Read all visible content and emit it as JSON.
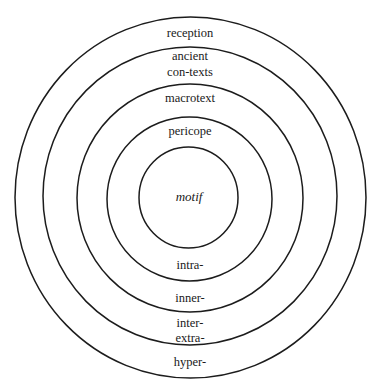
{
  "diagram": {
    "title": "",
    "style": {
      "stroke_color": "#1c1c1c",
      "text_color": "#1a1a1a",
      "background": "#ffffff"
    },
    "rings": [
      {
        "name": "outer",
        "cx": 190.5,
        "cy": 197.5,
        "rx": 175.5,
        "ry": 180.5
      },
      {
        "name": "second",
        "cx": 190,
        "cy": 196,
        "rx": 147,
        "ry": 149
      },
      {
        "name": "third",
        "cx": 190,
        "cy": 198,
        "rx": 113,
        "ry": 114
      },
      {
        "name": "fourth",
        "cx": 189.5,
        "cy": 199,
        "rx": 82.5,
        "ry": 82
      },
      {
        "name": "center",
        "cx": 188.5,
        "cy": 197.5,
        "rx": 49.5,
        "ry": 50.5
      }
    ],
    "labels": {
      "reception": "reception",
      "ancient": "ancient",
      "contexts": "con-texts",
      "macrotext": "macrotext",
      "pericope": "pericope",
      "motif": "motif",
      "intra": "intra-",
      "inner": "inner-",
      "inter": "inter-",
      "extra": "extra-",
      "hyper": "hyper-"
    }
  }
}
